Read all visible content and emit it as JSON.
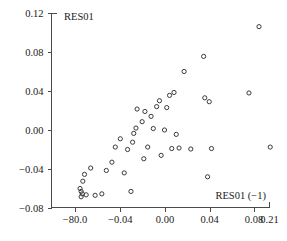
{
  "chart_data": {
    "type": "scatter",
    "title": "",
    "ylabel": "RES01",
    "xlabel": "RES01 (−1)",
    "xlim": [
      -0.1,
      0.128
    ],
    "ylim": [
      -0.08,
      0.12
    ],
    "grid": false,
    "legend": null,
    "marker": "open-circle",
    "marker_color": "#3a3a3a",
    "xticks": [
      -0.08,
      -0.04,
      0.0,
      0.04,
      0.08,
      0.21
    ],
    "xticklabels": [
      "−80.0",
      "−0.04",
      "0.00",
      "0.04",
      "0.08",
      "0.21"
    ],
    "yticks": [
      0.12,
      0.08,
      0.04,
      0.0,
      -0.04,
      -0.08
    ],
    "yticklabels": [
      "0.12",
      "0.08",
      "0.04",
      "0.00",
      "−0.04",
      "−0.08"
    ],
    "points": [
      {
        "x": -0.0745,
        "y": -0.0685
      },
      {
        "x": -0.0735,
        "y": -0.0655
      },
      {
        "x": -0.0745,
        "y": -0.063
      },
      {
        "x": -0.0755,
        "y": -0.06
      },
      {
        "x": -0.07,
        "y": -0.0665
      },
      {
        "x": -0.062,
        "y": -0.067
      },
      {
        "x": -0.073,
        "y": -0.0525
      },
      {
        "x": -0.0715,
        "y": -0.0455
      },
      {
        "x": -0.066,
        "y": -0.039
      },
      {
        "x": -0.056,
        "y": -0.0655
      },
      {
        "x": -0.052,
        "y": -0.0415
      },
      {
        "x": -0.047,
        "y": -0.033
      },
      {
        "x": -0.044,
        "y": -0.0175
      },
      {
        "x": -0.0395,
        "y": -0.009
      },
      {
        "x": -0.036,
        "y": -0.044
      },
      {
        "x": -0.033,
        "y": -0.02
      },
      {
        "x": -0.03,
        "y": -0.063
      },
      {
        "x": -0.0285,
        "y": -0.0125
      },
      {
        "x": -0.0275,
        "y": -0.0035
      },
      {
        "x": -0.0255,
        "y": 0.002
      },
      {
        "x": -0.0245,
        "y": 0.0215
      },
      {
        "x": -0.02,
        "y": 0.0085
      },
      {
        "x": -0.0185,
        "y": -0.0295
      },
      {
        "x": -0.0175,
        "y": 0.019
      },
      {
        "x": -0.015,
        "y": -0.0175
      },
      {
        "x": -0.012,
        "y": 0.014
      },
      {
        "x": -0.01,
        "y": 0.0015
      },
      {
        "x": -0.007,
        "y": 0.024
      },
      {
        "x": -0.0045,
        "y": 0.03
      },
      {
        "x": -0.003,
        "y": -0.026
      },
      {
        "x": 0.0,
        "y": 0.0
      },
      {
        "x": 0.002,
        "y": 0.023
      },
      {
        "x": 0.0045,
        "y": 0.0355
      },
      {
        "x": 0.0065,
        "y": -0.019
      },
      {
        "x": 0.0085,
        "y": 0.0385
      },
      {
        "x": 0.0105,
        "y": -0.0045
      },
      {
        "x": 0.013,
        "y": -0.0185
      },
      {
        "x": 0.0175,
        "y": 0.06
      },
      {
        "x": 0.0235,
        "y": -0.0195
      },
      {
        "x": 0.035,
        "y": 0.0755
      },
      {
        "x": 0.036,
        "y": 0.033
      },
      {
        "x": 0.0385,
        "y": -0.048
      },
      {
        "x": 0.04,
        "y": 0.029
      },
      {
        "x": 0.042,
        "y": -0.019
      },
      {
        "x": 0.0755,
        "y": 0.038
      },
      {
        "x": 0.0845,
        "y": 0.106
      },
      {
        "x": 0.0945,
        "y": -0.0175
      }
    ]
  },
  "labels": {
    "y_axis_title": "RES01",
    "x_axis_title": "RES01 (−1)"
  }
}
